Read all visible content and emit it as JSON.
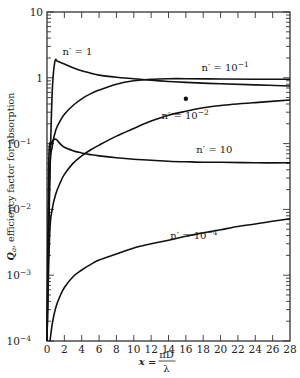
{
  "chart_data": {
    "type": "line",
    "title": "",
    "xlabel": "x = πD/λ",
    "xlabel_parts": {
      "var": "x",
      "eq": "=",
      "num": "πD",
      "den": "λ"
    },
    "ylabel": "Q_a, efficiency factor for absorption",
    "ylabel_parts": {
      "sym": "Q",
      "sub": "a",
      "rest": ", efficiency factor for absorption"
    },
    "xscale": "linear",
    "yscale": "log",
    "xlim": [
      0,
      28
    ],
    "ylim": [
      0.0001,
      10
    ],
    "grid": false,
    "x_ticks": [
      0,
      2,
      4,
      6,
      8,
      10,
      12,
      14,
      16,
      18,
      20,
      22,
      24,
      26,
      28
    ],
    "x_tick_labels": [
      "0",
      "2",
      "4",
      "6",
      "8",
      "10",
      "12",
      "14",
      "16",
      "18",
      "20",
      "22",
      "24",
      "26",
      "28"
    ],
    "y_ticks": [
      10,
      1,
      0.1,
      0.01,
      0.001,
      0.0001
    ],
    "y_tick_labels": [
      {
        "base": "10",
        "exp": ""
      },
      {
        "base": "1",
        "exp": ""
      },
      {
        "base": "10",
        "exp": "−1"
      },
      {
        "base": "10",
        "exp": "−2"
      },
      {
        "base": "10",
        "exp": "−3"
      },
      {
        "base": "10",
        "exp": "−4"
      }
    ],
    "series": [
      {
        "name": "n' = 1",
        "label_parts": {
          "pre": "n′ = ",
          "base": "1",
          "exp": ""
        },
        "x": [
          0,
          0.3,
          0.6,
          0.9,
          1.2,
          1.5,
          2,
          3,
          4,
          5,
          6,
          8,
          10,
          12,
          14,
          16,
          20,
          24,
          28
        ],
        "y": [
          0.0001,
          0.02,
          0.6,
          1.75,
          1.78,
          1.72,
          1.62,
          1.42,
          1.28,
          1.18,
          1.1,
          1.02,
          0.97,
          0.92,
          0.88,
          0.85,
          0.81,
          0.78,
          0.75
        ]
      },
      {
        "name": "n' = 10^-1",
        "label_parts": {
          "pre": "n′ = ",
          "base": "10",
          "exp": "−1"
        },
        "x": [
          0,
          0.3,
          0.6,
          1,
          1.5,
          2,
          3,
          4,
          5,
          6,
          8,
          10,
          12,
          14,
          16,
          20,
          24,
          28
        ],
        "y": [
          0.0001,
          0.03,
          0.09,
          0.16,
          0.22,
          0.28,
          0.38,
          0.48,
          0.57,
          0.65,
          0.8,
          0.9,
          0.95,
          0.97,
          0.97,
          0.96,
          0.95,
          0.95
        ]
      },
      {
        "name": "n' = 10^-2",
        "label_parts": {
          "pre": "n′ = ",
          "base": "10",
          "exp": "−2"
        },
        "x": [
          0,
          0.3,
          0.6,
          1,
          1.5,
          2,
          3,
          4,
          5,
          6,
          8,
          10,
          12,
          14,
          16,
          18,
          20,
          24,
          28
        ],
        "y": [
          0.0001,
          0.004,
          0.01,
          0.017,
          0.025,
          0.034,
          0.05,
          0.065,
          0.08,
          0.095,
          0.13,
          0.17,
          0.22,
          0.27,
          0.31,
          0.35,
          0.38,
          0.42,
          0.46
        ]
      },
      {
        "name": "n' = 10",
        "label_parts": {
          "pre": "n′ = ",
          "base": "10",
          "exp": ""
        },
        "x": [
          0,
          0.2,
          0.5,
          0.8,
          1.1,
          1.5,
          2,
          3,
          4,
          5,
          6,
          8,
          10,
          12,
          14,
          16,
          18,
          20,
          24,
          28
        ],
        "y": [
          0.0001,
          0.05,
          0.1,
          0.115,
          0.115,
          0.1,
          0.088,
          0.078,
          0.072,
          0.068,
          0.065,
          0.061,
          0.058,
          0.056,
          0.054,
          0.053,
          0.052,
          0.052,
          0.051,
          0.051
        ]
      },
      {
        "name": "n' = 10^-4",
        "label_parts": {
          "pre": "n′ = ",
          "base": "10",
          "exp": "−4"
        },
        "x": [
          0.35,
          0.6,
          1,
          1.5,
          2,
          3,
          4,
          5,
          6,
          8,
          10,
          12,
          14,
          16,
          18,
          20,
          22,
          24,
          26,
          28
        ],
        "y": [
          0.0001,
          0.00018,
          0.00032,
          0.00048,
          0.00065,
          0.00095,
          0.0012,
          0.00145,
          0.0017,
          0.0021,
          0.0026,
          0.003,
          0.0034,
          0.0039,
          0.0044,
          0.0049,
          0.0055,
          0.006,
          0.0066,
          0.0072
        ]
      }
    ],
    "points": [
      {
        "name": "marker",
        "x": 16.0,
        "y": 0.48
      }
    ],
    "annotations": [
      {
        "series": "n' = 1",
        "x": 1.8,
        "y": 2.2
      },
      {
        "series": "n' = 10^-1",
        "x": 17.8,
        "y": 1.25
      },
      {
        "series": "n' = 10^-2",
        "x": 13.2,
        "y": 0.24
      },
      {
        "series": "n' = 10",
        "x": 17.2,
        "y": 0.072
      },
      {
        "series": "n' = 10^-4",
        "x": 14.2,
        "y": 0.0036
      }
    ]
  }
}
